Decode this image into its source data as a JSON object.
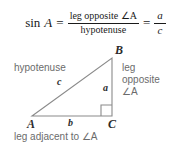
{
  "formula": {
    "function_label": "sin",
    "angle_label": "A",
    "equals": "=",
    "numerator": "leg opposite ∠A",
    "denominator": "hypotenuse",
    "equals2": "=",
    "ratio_numerator": "a",
    "ratio_denominator": "c",
    "full_text": "sin A = leg opposite ∠A / hypotenuse = a / c"
  },
  "diagram": {
    "type": "right-triangle",
    "vertices": {
      "A": "A",
      "B": "B",
      "C": "C"
    },
    "sides": {
      "hypotenuse_name": "hypotenuse",
      "hypotenuse_label": "c",
      "opposite_label": "a",
      "adjacent_label": "b"
    },
    "annotations": {
      "opposite_line1": "leg",
      "opposite_line2": "opposite",
      "opposite_line3": "∠A",
      "adjacent_caption": "leg adjacent to ∠A"
    },
    "right_angle_vertex": "C",
    "colors": {
      "stroke": "#8a8a8a",
      "label_gray": "#6b6b6b",
      "vertex_dark": "#2b2b2b",
      "background": "#ffffff"
    }
  }
}
